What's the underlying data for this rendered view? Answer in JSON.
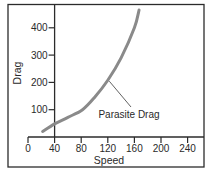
{
  "chart_data": {
    "type": "line",
    "title": "",
    "xlabel": "Speed",
    "ylabel": "Drag",
    "xlim": [
      0,
      260
    ],
    "ylim": [
      0,
      475
    ],
    "x_ticks": [
      0,
      40,
      80,
      120,
      160,
      200,
      240
    ],
    "y_ticks": [
      100,
      200,
      300,
      400
    ],
    "grid": false,
    "legend": null,
    "series": [
      {
        "name": "Parasite Drag",
        "color": "#8a8a8a",
        "x": [
          22,
          40,
          60,
          82,
          100,
          120,
          140,
          160,
          167
        ],
        "y": [
          20,
          48,
          72,
          100,
          145,
          208,
          290,
          400,
          465
        ]
      }
    ],
    "annotations": [
      {
        "text": "Parasite Drag",
        "points_to": {
          "x": 120,
          "y": 208
        }
      }
    ]
  },
  "colors": {
    "frame": "#2b2b2b",
    "axis": "#2b2b2b",
    "curve": "#8a8a8a",
    "text": "#2a2a2a",
    "background": "#ffffff"
  }
}
